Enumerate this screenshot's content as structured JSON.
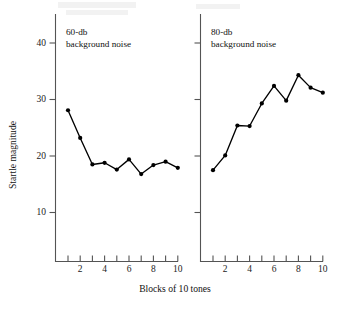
{
  "figure": {
    "width": 351,
    "height": 311,
    "background": "#ffffff",
    "ink_color": "#000000",
    "axis_color": "#545454"
  },
  "axis_titles": {
    "x": "Blocks of 10 tones",
    "y": "Startle magnitude"
  },
  "chart_data": {
    "type": "line",
    "title": "",
    "xlabel": "Blocks of 10 tones",
    "ylabel": "Startle magnitude",
    "xlim": [
      0.4,
      10.8
    ],
    "ylim": [
      5.5,
      44
    ],
    "grid": false,
    "legend": "none",
    "x": [
      1,
      2,
      3,
      4,
      5,
      6,
      7,
      8,
      9,
      10
    ],
    "xticks": [
      1,
      2,
      3,
      4,
      5,
      6,
      7,
      8,
      9,
      10
    ],
    "xticklabels": [
      "",
      "2",
      "",
      "4",
      "",
      "6",
      "",
      "8",
      "",
      "10"
    ],
    "yticks": [
      10,
      20,
      30,
      40
    ],
    "yticklabels": [
      "10",
      "20",
      "30",
      "40"
    ],
    "panels": [
      {
        "id": "panel-60db",
        "annotation_line1": "60-db",
        "annotation_line2": "background noise",
        "y_axis_labeled": true,
        "series": [
          {
            "name": "60-db background noise",
            "values": [
              28.1,
              23.2,
              18.5,
              18.8,
              17.6,
              19.4,
              16.8,
              18.4,
              19.0,
              17.9
            ]
          }
        ]
      },
      {
        "id": "panel-80db",
        "annotation_line1": "80-db",
        "annotation_line2": "background noise",
        "y_axis_labeled": false,
        "series": [
          {
            "name": "80-db background noise",
            "values": [
              17.5,
              20.1,
              25.4,
              25.3,
              29.3,
              32.4,
              29.8,
              34.3,
              32.1,
              31.2
            ]
          }
        ]
      }
    ]
  }
}
